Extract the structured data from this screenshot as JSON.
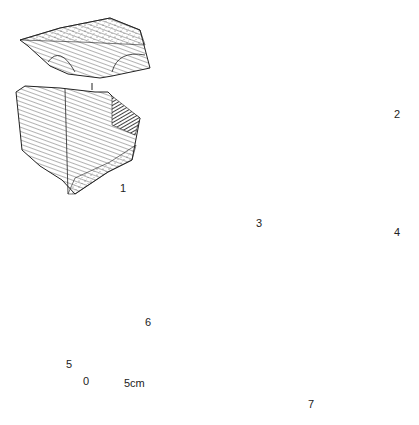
{
  "figure": {
    "type": "lithic-artifact-plate",
    "artifacts": [
      {
        "id": 1,
        "label": "1",
        "views": 2,
        "description": "core, platform view above and face view below"
      },
      {
        "id": 2,
        "label": "2",
        "views": 3,
        "description": "core, two faces and section"
      },
      {
        "id": 3,
        "label": "3",
        "views": 2,
        "description": "flake/tool, two faces"
      },
      {
        "id": 4,
        "label": "4",
        "views": 3,
        "description": "flake, two faces and section"
      },
      {
        "id": 5,
        "label": "5",
        "views": 2,
        "description": "tool, face and cross-section"
      },
      {
        "id": 6,
        "label": "6",
        "views": 3,
        "description": "bladelet, platform and two faces"
      },
      {
        "id": 7,
        "label": "7",
        "views": 2,
        "description": "core, face and outline section"
      }
    ],
    "scale_bar": {
      "start_label": "0",
      "end_label": "5cm"
    }
  }
}
